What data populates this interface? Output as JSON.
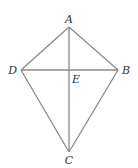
{
  "diagram": {
    "type": "kite",
    "points": {
      "A": {
        "label": "A",
        "x": 69,
        "y": 27
      },
      "B": {
        "label": "B",
        "x": 118,
        "y": 70
      },
      "C": {
        "label": "C",
        "x": 69,
        "y": 152
      },
      "D": {
        "label": "D",
        "x": 21,
        "y": 70
      },
      "E": {
        "label": "E",
        "x": 69,
        "y": 70
      }
    },
    "segments": [
      "AB",
      "BC",
      "CD",
      "DA",
      "AC",
      "DB"
    ]
  }
}
